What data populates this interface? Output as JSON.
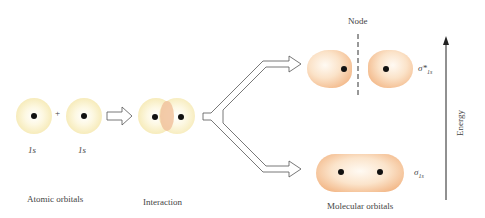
{
  "diagram": {
    "stages": {
      "atomic": {
        "label": "Atomic orbitals",
        "orbital_left": "1s",
        "orbital_right": "1s",
        "operator": "+"
      },
      "interaction": {
        "label": "Interaction"
      },
      "molecular": {
        "label": "Molecular orbitals"
      }
    },
    "antibonding": {
      "symbol": "σ*",
      "subscript": "1s",
      "node_label": "Node"
    },
    "bonding": {
      "symbol": "σ",
      "subscript": "1s"
    },
    "axis": {
      "label": "Energy",
      "direction": "up"
    },
    "colors": {
      "atomic_orbital": "#f4e6a8",
      "molecular_orbital": "#f0a673",
      "overlap_region": "#f1c6a0",
      "arrow_stroke": "#555555",
      "nucleus": "#111111"
    }
  }
}
